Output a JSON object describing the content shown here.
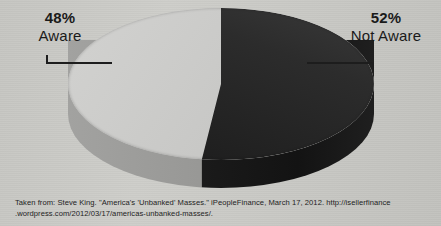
{
  "figure": {
    "background_color": "#c8c8c4",
    "caption_line1": "Taken from: Steve King. \"America's 'Unbanked' Masses.\" iPeopleFinance, March 17, 2012. http://isellerfinance",
    "caption_line2": ".wordpress.com/2012/03/17/americas-unbanked-masses/."
  },
  "labels": {
    "left": {
      "percent": "48%",
      "name": "Aware"
    },
    "right": {
      "percent": "52%",
      "name": "Not Aware"
    }
  },
  "chart_data": {
    "type": "pie",
    "title": "",
    "categories": [
      "Aware",
      "Not Aware"
    ],
    "values": [
      48,
      52
    ],
    "value_labels": [
      "48%",
      "52%"
    ],
    "colors": [
      "#cacac8",
      "#232323"
    ],
    "side_colors": [
      "#9b9b99",
      "#1b1b1b"
    ],
    "legend": "none",
    "annotations": [
      "48% Aware",
      "52% Not Aware"
    ],
    "three_d": true,
    "units": "percent"
  }
}
